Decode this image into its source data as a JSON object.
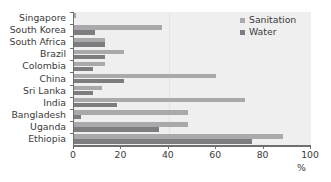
{
  "chart_data": {
    "type": "bar",
    "orientation": "horizontal",
    "title": "",
    "xlabel": "%",
    "ylabel": "",
    "xlim": [
      0,
      100
    ],
    "xticks": [
      0,
      20,
      40,
      60,
      80,
      100
    ],
    "grid": false,
    "legend_position": "top-right",
    "categories": [
      "Singapore",
      "South Korea",
      "South Africa",
      "Brazil",
      "Colombia",
      "China",
      "Sri Lanka",
      "India",
      "Bangladesh",
      "Uganda",
      "Ethiopia"
    ],
    "series": [
      {
        "name": "Sanitation",
        "color": "#a9a9ab",
        "values": [
          1,
          37,
          13,
          21,
          13,
          60,
          12,
          72,
          48,
          48,
          88
        ]
      },
      {
        "name": "Water",
        "color": "#7d7d80",
        "values": [
          0,
          9,
          13,
          13,
          8,
          21,
          8,
          18,
          3,
          36,
          75
        ]
      }
    ]
  },
  "axis": {
    "unit_label": "%",
    "tick_labels": [
      "0",
      "20",
      "40",
      "60",
      "80",
      "100"
    ]
  },
  "legend": {
    "items": [
      {
        "label": "Sanitation",
        "color": "#a9a9ab"
      },
      {
        "label": "Water",
        "color": "#7d7d80"
      }
    ]
  }
}
